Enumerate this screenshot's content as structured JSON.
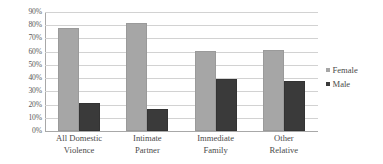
{
  "chart_data": {
    "type": "bar",
    "title": "",
    "xlabel": "",
    "ylabel": "",
    "ylim": [
      0,
      90
    ],
    "ytick_step": 10,
    "grid": true,
    "legend_position": "right",
    "categories": [
      {
        "line1": "All Domestic",
        "line2": "Violence"
      },
      {
        "line1": "Intimate",
        "line2": "Partner"
      },
      {
        "line1": "Immediate",
        "line2": "Family"
      },
      {
        "line1": "Other",
        "line2": "Relative"
      }
    ],
    "ytick_labels": [
      "90%",
      "80%",
      "70%",
      "60%",
      "50%",
      "40%",
      "30%",
      "20%",
      "10%",
      "0%"
    ],
    "series": [
      {
        "name": "Female",
        "color": "#a6a6a6",
        "values": [
          78,
          82,
          60.5,
          61.5
        ]
      },
      {
        "name": "Male",
        "color": "#3a3a3a",
        "values": [
          21,
          17,
          39,
          37.5
        ]
      }
    ]
  },
  "legend": {
    "items": [
      {
        "label": "Female"
      },
      {
        "label": "Male"
      }
    ]
  },
  "colors": {
    "female": "#a6a6a6",
    "male": "#3a3a3a",
    "gridline": "#d2d2d2",
    "axis": "#a8a8a8",
    "text": "#4a4a4a",
    "background": "#ffffff"
  }
}
